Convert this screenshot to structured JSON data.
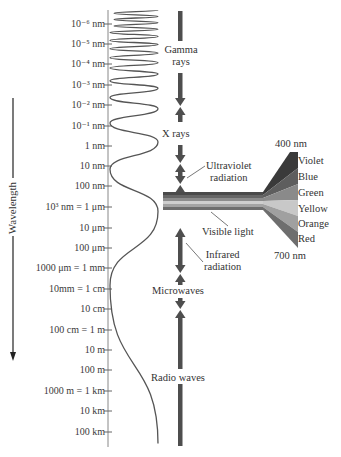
{
  "diagram": {
    "axis_title": "Wavelength",
    "ticks": [
      {
        "label": "10⁻⁶ nm",
        "y": 24
      },
      {
        "label": "10⁻⁵ nm",
        "y": 44
      },
      {
        "label": "10⁻⁴ nm",
        "y": 64
      },
      {
        "label": "10⁻³ nm",
        "y": 85
      },
      {
        "label": "10⁻² nm",
        "y": 105
      },
      {
        "label": "10⁻¹ nm",
        "y": 126
      },
      {
        "label": "1 nm",
        "y": 146
      },
      {
        "label": "10 nm",
        "y": 166
      },
      {
        "label": "100 nm",
        "y": 186
      },
      {
        "label": "10³ nm = 1 μm",
        "y": 207
      },
      {
        "label": "10 μm",
        "y": 228
      },
      {
        "label": "100 μm",
        "y": 248
      },
      {
        "label": "1000 μm = 1 mm",
        "y": 268
      },
      {
        "label": "10mm = 1 cm",
        "y": 289
      },
      {
        "label": "10 cm",
        "y": 309
      },
      {
        "label": "100 cm = 1 m",
        "y": 330
      },
      {
        "label": "10 m",
        "y": 350
      },
      {
        "label": "100 m",
        "y": 370
      },
      {
        "label": "1000 m = 1 km",
        "y": 391
      },
      {
        "label": "10 km",
        "y": 411
      },
      {
        "label": "100 km",
        "y": 432
      }
    ],
    "bands": {
      "gamma": "Gamma\nrays",
      "gamma_line1": "Gamma",
      "gamma_line2": "rays",
      "xrays": "X rays",
      "uv_line1": "Ultraviolet",
      "uv_line2": "radiation",
      "visible": "Visible light",
      "ir_line1": "Infrared",
      "ir_line2": "radiation",
      "microwaves": "Microwaves",
      "radio": "Radio waves"
    },
    "visible_spectrum": {
      "top_wavelength": "400 nm",
      "bottom_wavelength": "700 nm",
      "colors": [
        {
          "name": "Violet",
          "shade": "#3a3a3a"
        },
        {
          "name": "Blue",
          "shade": "#5e5e5e"
        },
        {
          "name": "Green",
          "shade": "#8a8a8a"
        },
        {
          "name": "Yellow",
          "shade": "#c8c8c8"
        },
        {
          "name": "Orange",
          "shade": "#a0a0a0"
        },
        {
          "name": "Red",
          "shade": "#6e6e6e"
        }
      ]
    },
    "colors": {
      "ink": "#333333",
      "arrow": "#505050",
      "axis": "#777777"
    }
  }
}
